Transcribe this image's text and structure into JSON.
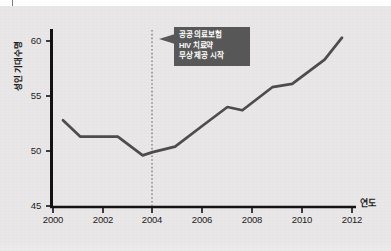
{
  "chart_data": {
    "type": "line",
    "title": "",
    "subtitle": "",
    "xlabel": "연도",
    "ylabel": "성인 기대수명",
    "xlim": [
      2000,
      2012
    ],
    "ylim": [
      45,
      61.5
    ],
    "grid": false,
    "legend": null,
    "x_ticks": [
      "2000",
      "2002",
      "2004",
      "2006",
      "2008",
      "2010",
      "2012"
    ],
    "y_ticks": [
      "45",
      "50",
      "55",
      "60"
    ],
    "series": [
      {
        "name": "성인 기대수명",
        "color": "#4d4d4d",
        "points": [
          {
            "x": 2000.4,
            "y": 52.8
          },
          {
            "x": 2001.1,
            "y": 51.3
          },
          {
            "x": 2002.6,
            "y": 51.3
          },
          {
            "x": 2003.6,
            "y": 49.6
          },
          {
            "x": 2004.0,
            "y": 49.9
          },
          {
            "x": 2004.9,
            "y": 50.4
          },
          {
            "x": 2006.0,
            "y": 52.3
          },
          {
            "x": 2007.0,
            "y": 54.0
          },
          {
            "x": 2007.6,
            "y": 53.7
          },
          {
            "x": 2008.8,
            "y": 55.8
          },
          {
            "x": 2009.6,
            "y": 56.1
          },
          {
            "x": 2010.9,
            "y": 58.3
          },
          {
            "x": 2011.6,
            "y": 60.3
          }
        ]
      }
    ],
    "annotations": [
      {
        "name": "policy-event",
        "at_x": 2004,
        "marker": "dotted-vertical-line",
        "color": "#585858",
        "lines": [
          "공공 의료보험",
          "HIV 치료약",
          "무상 제공 시작"
        ]
      }
    ]
  },
  "axes": {
    "y_title": "성인 기대수명",
    "x_title": "연도"
  },
  "callout": {
    "line1": "공공 의료보험",
    "line2": "HIV 치료약",
    "line3": "무상 제공 시작"
  },
  "y_labels": {
    "t60": "60",
    "t55": "55",
    "t50": "50",
    "t45": "45"
  },
  "x_labels": {
    "x2000": "2000",
    "x2002": "2002",
    "x2004": "2004",
    "x2006": "2006",
    "x2008": "2008",
    "x2010": "2010",
    "x2012": "2012"
  }
}
